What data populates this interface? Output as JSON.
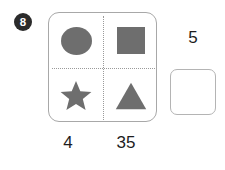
{
  "problem": {
    "number_badge": "8",
    "panel": {
      "cells": [
        {
          "position": "top-left",
          "icon": "circle-icon"
        },
        {
          "position": "top-right",
          "icon": "square-icon"
        },
        {
          "position": "bottom-left",
          "icon": "star-icon"
        },
        {
          "position": "bottom-right",
          "icon": "triangle-icon"
        }
      ]
    },
    "column_totals": [
      {
        "label": "4"
      },
      {
        "label": "35"
      }
    ],
    "row_totals": [
      {
        "label": "5"
      }
    ],
    "answer_box": {
      "value": "",
      "placeholder": ""
    }
  },
  "colors": {
    "shape_fill": "#6e6e6e",
    "panel_border": "#a8a8a8",
    "divider": "#9a9a9a",
    "badge_background": "#2b2b2b",
    "badge_text": "#ffffff",
    "label_text": "#1d1d1d",
    "answer_box_border": "#b4b4b4"
  }
}
